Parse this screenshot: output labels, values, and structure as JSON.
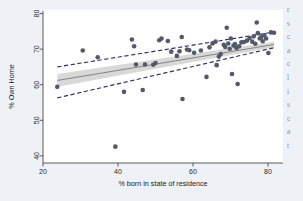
{
  "figure": {
    "name": "scatter-with-linear-fit",
    "background_color": "#eef1f5",
    "plot_background_color": "#ffffff"
  },
  "colors": {
    "marker": "#53586a",
    "fit_line": "#6f7a6a",
    "confidence_band_fill": "#c9c9c9",
    "prediction_band_line": "#2b2f6b",
    "axis": "#4a4a4a",
    "page_background": "#eef1f5"
  },
  "side_column": {
    "name": "adjacent-document-text-fragments",
    "lines": [
      "r",
      "s",
      "c",
      "a",
      "c",
      "l",
      "i",
      "s",
      "c",
      "a",
      "t"
    ]
  },
  "chart_data": {
    "type": "scatter",
    "title": "",
    "xlabel": "% born in state of residence",
    "ylabel": "% Own Home",
    "xlim": [
      20,
      84
    ],
    "ylim": [
      38,
      81
    ],
    "xticks": [
      20,
      40,
      60,
      80
    ],
    "yticks": [
      40,
      50,
      60,
      70,
      80
    ],
    "grid": false,
    "legend": "none",
    "series": [
      {
        "name": "States",
        "marker": "circle",
        "points": [
          [
            23.8,
            59.4
          ],
          [
            30.6,
            69.6
          ],
          [
            34.6,
            67.7
          ],
          [
            39.3,
            42.6
          ],
          [
            41.6,
            58.0
          ],
          [
            43.7,
            72.7
          ],
          [
            44.3,
            70.8
          ],
          [
            44.8,
            65.7
          ],
          [
            46.6,
            58.5
          ],
          [
            47.2,
            65.7
          ],
          [
            49.4,
            65.6
          ],
          [
            50.0,
            66.1
          ],
          [
            51.0,
            72.5
          ],
          [
            51.6,
            73.0
          ],
          [
            53.3,
            72.3
          ],
          [
            54.2,
            69.3
          ],
          [
            55.7,
            68.1
          ],
          [
            56.4,
            69.4
          ],
          [
            57.0,
            73.4
          ],
          [
            57.2,
            56.0
          ],
          [
            58.4,
            69.9
          ],
          [
            59.0,
            69.7
          ],
          [
            60.3,
            69.0
          ],
          [
            62.1,
            69.6
          ],
          [
            63.6,
            62.2
          ],
          [
            64.4,
            70.5
          ],
          [
            65.2,
            71.6
          ],
          [
            66.0,
            72.1
          ],
          [
            66.3,
            65.5
          ],
          [
            66.9,
            67.9
          ],
          [
            67.4,
            68.6
          ],
          [
            68.2,
            71.2
          ],
          [
            68.6,
            70.6
          ],
          [
            69.0,
            76.0
          ],
          [
            69.4,
            71.6
          ],
          [
            69.8,
            70.1
          ],
          [
            70.1,
            73.0
          ],
          [
            70.4,
            63.0
          ],
          [
            70.8,
            71.0
          ],
          [
            71.2,
            71.4
          ],
          [
            71.6,
            70.3
          ],
          [
            71.9,
            60.2
          ],
          [
            72.3,
            70.8
          ],
          [
            72.9,
            71.9
          ],
          [
            73.6,
            72.0
          ],
          [
            74.4,
            72.4
          ],
          [
            75.1,
            73.1
          ],
          [
            75.8,
            72.1
          ],
          [
            76.2,
            73.6
          ],
          [
            76.6,
            71.5
          ],
          [
            77.0,
            77.5
          ],
          [
            77.3,
            74.5
          ],
          [
            77.8,
            73.0
          ],
          [
            78.2,
            73.4
          ],
          [
            78.6,
            72.2
          ],
          [
            79.0,
            73.9
          ],
          [
            79.5,
            73.0
          ],
          [
            80.1,
            68.9
          ],
          [
            80.8,
            74.7
          ],
          [
            81.6,
            74.6
          ]
        ]
      }
    ],
    "fit_line": {
      "name": "linear-fit",
      "x": [
        23.8,
        81.6
      ],
      "y": [
        61.2,
        71.3
      ]
    },
    "confidence_band": {
      "name": "confidence-interval-95",
      "x": [
        23.8,
        81.6
      ],
      "upper": [
        63.0,
        72.1
      ],
      "lower": [
        59.4,
        70.5
      ]
    },
    "prediction_band": {
      "name": "prediction-interval-95",
      "x": [
        23.8,
        81.6
      ],
      "upper": [
        65.0,
        74.8
      ],
      "lower": [
        56.3,
        70.4
      ]
    }
  }
}
